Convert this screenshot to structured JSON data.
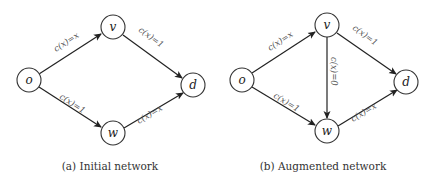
{
  "panels": [
    {
      "id": "a",
      "caption": "(a) Initial network",
      "nodes": {
        "o": "o",
        "v": "v",
        "w": "w",
        "d": "d"
      },
      "edges": [
        {
          "from": "o",
          "to": "v",
          "label": "c(x)=x"
        },
        {
          "from": "v",
          "to": "d",
          "label": "c(x)=1"
        },
        {
          "from": "o",
          "to": "w",
          "label": "c(x)=1"
        },
        {
          "from": "w",
          "to": "d",
          "label": "c(x)=x"
        }
      ]
    },
    {
      "id": "b",
      "caption": "(b) Augmented network",
      "nodes": {
        "o": "o",
        "v": "v",
        "w": "w",
        "d": "d"
      },
      "edges": [
        {
          "from": "o",
          "to": "v",
          "label": "c(x)=x"
        },
        {
          "from": "v",
          "to": "d",
          "label": "c(x)=1"
        },
        {
          "from": "v",
          "to": "w",
          "label": "c(x)=0"
        },
        {
          "from": "o",
          "to": "w",
          "label": "c(x)=1"
        },
        {
          "from": "w",
          "to": "d",
          "label": "c(x)=x"
        }
      ]
    }
  ]
}
